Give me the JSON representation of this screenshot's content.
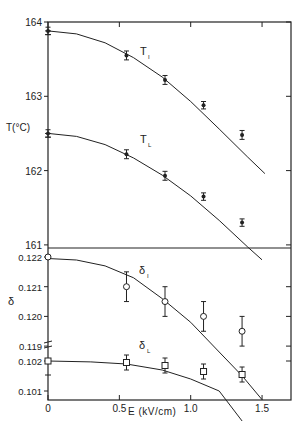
{
  "chart_data": [
    {
      "type": "line",
      "panel": "top",
      "title": "",
      "xlabel": "E (kV/cm)",
      "ylabel": "T(°C)",
      "ylim": [
        161,
        164
      ],
      "xlim": [
        0,
        1.7
      ],
      "yticks": [
        "164",
        "163",
        "162",
        "161"
      ],
      "series": [
        {
          "name": "T_I",
          "label_main": "T",
          "label_sub": "I",
          "marker": "filled-circle",
          "points": [
            {
              "x": 0,
              "y": 163.88,
              "err": 0.05
            },
            {
              "x": 0.55,
              "y": 163.55,
              "err": 0.06
            },
            {
              "x": 0.82,
              "y": 163.22,
              "err": 0.06
            },
            {
              "x": 1.09,
              "y": 162.88,
              "err": 0.05
            },
            {
              "x": 1.36,
              "y": 162.48,
              "err": 0.06
            }
          ],
          "fit_curve": [
            [
              0,
              163.88
            ],
            [
              0.2,
              163.84
            ],
            [
              0.4,
              163.72
            ],
            [
              0.6,
              163.52
            ],
            [
              0.8,
              163.26
            ],
            [
              1.0,
              162.93
            ],
            [
              1.2,
              162.56
            ],
            [
              1.4,
              162.18
            ],
            [
              1.52,
              161.96
            ]
          ]
        },
        {
          "name": "T_L",
          "label_main": "T",
          "label_sub": "L",
          "marker": "filled-circle",
          "points": [
            {
              "x": 0,
              "y": 162.5,
              "err": 0.05
            },
            {
              "x": 0.55,
              "y": 162.22,
              "err": 0.06
            },
            {
              "x": 0.82,
              "y": 161.93,
              "err": 0.06
            },
            {
              "x": 1.09,
              "y": 161.65,
              "err": 0.05
            },
            {
              "x": 1.36,
              "y": 161.3,
              "err": 0.05
            }
          ],
          "fit_curve": [
            [
              0,
              162.5
            ],
            [
              0.2,
              162.46
            ],
            [
              0.4,
              162.35
            ],
            [
              0.6,
              162.17
            ],
            [
              0.8,
              161.94
            ],
            [
              1.0,
              161.66
            ],
            [
              1.2,
              161.33
            ],
            [
              1.4,
              160.97
            ],
            [
              1.5,
              160.8
            ]
          ]
        }
      ]
    },
    {
      "type": "line",
      "panel": "bottom",
      "title": "",
      "xlabel": "E (kV/cm)",
      "ylabel": "δ",
      "axis_break": true,
      "upper_range": [
        0.119,
        0.122
      ],
      "lower_range": [
        0.101,
        0.102
      ],
      "yticks": [
        "0.122",
        "0.121",
        "0.120",
        "0.119",
        "0.102",
        "0.101"
      ],
      "xticks": [
        "0",
        "0.5",
        "1.0",
        "1.5"
      ],
      "series": [
        {
          "name": "δ_I",
          "label_main": "δ",
          "label_sub": "I",
          "marker": "open-circle",
          "points": [
            {
              "x": 0,
              "y": 0.122,
              "err": 0.0
            },
            {
              "x": 0.55,
              "y": 0.121,
              "err": 0.0005
            },
            {
              "x": 0.82,
              "y": 0.1205,
              "err": 0.0005
            },
            {
              "x": 1.09,
              "y": 0.12,
              "err": 0.0005
            },
            {
              "x": 1.36,
              "y": 0.1195,
              "err": 0.0005
            }
          ],
          "fit_curve": [
            [
              0,
              0.12195
            ],
            [
              0.2,
              0.1219
            ],
            [
              0.4,
              0.1217
            ],
            [
              0.6,
              0.1213
            ],
            [
              0.8,
              0.1206
            ],
            [
              1.0,
              0.1198
            ],
            [
              1.2,
              0.1188
            ],
            [
              1.36,
              0.118
            ],
            [
              1.5,
              0.1172
            ]
          ]
        },
        {
          "name": "δ_L",
          "label_main": "δ",
          "label_sub": "L",
          "marker": "open-square",
          "points": [
            {
              "x": 0,
              "y": 0.102,
              "err": 0.0
            },
            {
              "x": 0.55,
              "y": 0.10195,
              "err": 0.00025
            },
            {
              "x": 0.82,
              "y": 0.10185,
              "err": 0.00025
            },
            {
              "x": 1.09,
              "y": 0.10165,
              "err": 0.00025
            },
            {
              "x": 1.36,
              "y": 0.10155,
              "err": 0.00025
            }
          ],
          "fit_curve": [
            [
              0,
              0.102
            ],
            [
              0.3,
              0.10197
            ],
            [
              0.55,
              0.1019
            ],
            [
              0.8,
              0.1017
            ],
            [
              1.0,
              0.1014
            ],
            [
              1.2,
              0.101
            ],
            [
              1.36,
              0.1
            ]
          ]
        }
      ]
    }
  ],
  "labels": {
    "top_ylabel": "T(°C)",
    "bottom_ylabel": "δ",
    "xlabel": "E (kV/cm)",
    "series_TI_main": "T",
    "series_TI_sub": "I",
    "series_TL_main": "T",
    "series_TL_sub": "L",
    "series_dI_main": "δ",
    "series_dI_sub": "I",
    "series_dL_main": "δ",
    "series_dL_sub": "L"
  },
  "colors": {
    "ink": "#222222",
    "background": "#ffffff"
  }
}
